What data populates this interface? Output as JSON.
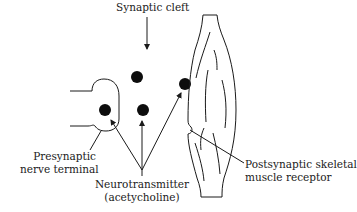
{
  "diagram": {
    "type": "neuromuscular junction schematic",
    "labels": {
      "synaptic_cleft": "Synaptic cleft",
      "presynaptic_line1": "Presynaptic",
      "presynaptic_line2": "nerve terminal",
      "neurotransmitter_line1": "Neurotransmitter",
      "neurotransmitter_line2": "(acetycholine)",
      "postsynaptic_line1": "Postsynaptic skeletal",
      "postsynaptic_line2": "muscle receptor"
    },
    "elements": [
      {
        "id": "presynaptic-terminal",
        "shape": "rounded U outline"
      },
      {
        "id": "neurotransmitter-dots",
        "count": 4
      },
      {
        "id": "muscle-fiber",
        "shape": "spindle outline with striations"
      },
      {
        "id": "receptor-notch",
        "shape": "small semicircular notch on muscle"
      }
    ],
    "colors": {
      "stroke": "#1a1a1a",
      "fill_dots": "#0d0d0d",
      "background": "#ffffff"
    }
  }
}
